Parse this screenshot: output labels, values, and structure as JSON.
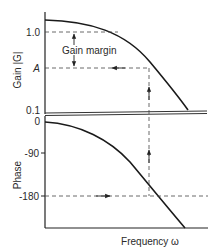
{
  "diagram": {
    "gain_plot": {
      "ylabel": "Gain |G|",
      "ticks": [
        "1.0",
        "A",
        "0.1"
      ],
      "annotation": "Gain margin"
    },
    "phase_plot": {
      "ylabel": "Phase",
      "ticks": [
        "0",
        "-90",
        "-180"
      ]
    },
    "xlabel": "Frequency ω"
  }
}
